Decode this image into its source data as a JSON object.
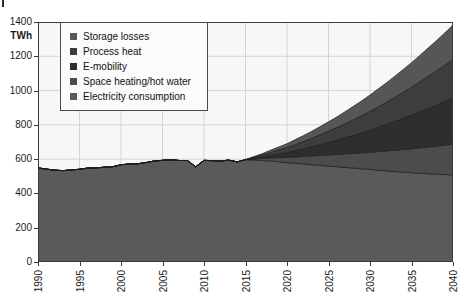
{
  "chart_data": {
    "type": "area",
    "stacked": true,
    "title": "",
    "subtitle": "",
    "xlabel": "",
    "ylabel": "TWh",
    "unit_label": "TWh",
    "grid": true,
    "legend_position": "top-left-inside",
    "xlim": [
      1990,
      2040
    ],
    "ylim": [
      0,
      1400
    ],
    "ytick_step": 200,
    "ytick_labels": [
      "0",
      "200",
      "400",
      "600",
      "800",
      "1000",
      "1200",
      "1400"
    ],
    "ytick_values": [
      0,
      200,
      400,
      600,
      800,
      1000,
      1200,
      1400
    ],
    "xtick_labels": [
      "1990",
      "1995",
      "2000",
      "2005",
      "2010",
      "2015",
      "2020",
      "2025",
      "2030",
      "2035",
      "2040"
    ],
    "xtick_values": [
      1990,
      1995,
      2000,
      2005,
      2010,
      2015,
      2020,
      2025,
      2030,
      2035,
      2040
    ],
    "x": [
      1990,
      1991,
      1992,
      1993,
      1994,
      1995,
      1996,
      1997,
      1998,
      1999,
      2000,
      2001,
      2002,
      2003,
      2004,
      2005,
      2006,
      2007,
      2008,
      2009,
      2010,
      2011,
      2012,
      2013,
      2014,
      2015,
      2016,
      2017,
      2018,
      2019,
      2020,
      2021,
      2022,
      2023,
      2024,
      2025,
      2026,
      2027,
      2028,
      2029,
      2030,
      2031,
      2032,
      2033,
      2034,
      2035,
      2036,
      2037,
      2038,
      2039,
      2040
    ],
    "series": [
      {
        "name": "Electricity consumption",
        "color": "#5a5a5a",
        "values": [
          549,
          542,
          536,
          533,
          537,
          541,
          548,
          549,
          553,
          556,
          567,
          572,
          573,
          580,
          589,
          593,
          597,
          592,
          592,
          555,
          593,
          591,
          590,
          594,
          584,
          597,
          595,
          592,
          589,
          585,
          580,
          576,
          572,
          568,
          564,
          560,
          556,
          552,
          548,
          544,
          540,
          536,
          532,
          528,
          524,
          521,
          518,
          515,
          512,
          510,
          508
        ]
      },
      {
        "name": "Space heating/hot water",
        "color": "#4c4c4c",
        "values": [
          0,
          0,
          0,
          0,
          0,
          0,
          0,
          0,
          0,
          0,
          0,
          0,
          0,
          0,
          0,
          0,
          0,
          0,
          0,
          0,
          0,
          0,
          0,
          0,
          0,
          0,
          6,
          12,
          18,
          24,
          30,
          37,
          44,
          51,
          58,
          65,
          72,
          79,
          86,
          93,
          100,
          108,
          116,
          124,
          132,
          140,
          148,
          156,
          164,
          172,
          180
        ]
      },
      {
        "name": "E-mobility",
        "color": "#2e2e2e",
        "values": [
          0,
          0,
          0,
          0,
          0,
          0,
          0,
          0,
          0,
          0,
          0,
          0,
          0,
          0,
          0,
          0,
          0,
          0,
          0,
          0,
          0,
          0,
          0,
          0,
          0,
          0,
          5,
          10,
          16,
          22,
          29,
          37,
          45,
          54,
          63,
          73,
          83,
          94,
          105,
          117,
          129,
          142,
          155,
          168,
          182,
          196,
          210,
          225,
          240,
          255,
          270
        ]
      },
      {
        "name": "Process heat",
        "color": "#3d3d3d",
        "values": [
          0,
          0,
          0,
          0,
          0,
          0,
          0,
          0,
          0,
          0,
          0,
          0,
          0,
          0,
          0,
          0,
          0,
          0,
          0,
          0,
          0,
          0,
          0,
          0,
          0,
          0,
          5,
          10,
          16,
          22,
          28,
          35,
          42,
          49,
          57,
          65,
          73,
          82,
          91,
          100,
          110,
          120,
          130,
          141,
          152,
          163,
          175,
          187,
          199,
          211,
          224
        ]
      },
      {
        "name": "Storage losses",
        "color": "#565656",
        "values": [
          0,
          0,
          0,
          0,
          0,
          0,
          0,
          0,
          0,
          0,
          0,
          0,
          0,
          0,
          0,
          0,
          0,
          0,
          0,
          0,
          0,
          0,
          0,
          0,
          0,
          0,
          4,
          8,
          13,
          18,
          23,
          29,
          35,
          41,
          48,
          55,
          62,
          70,
          78,
          86,
          95,
          104,
          113,
          123,
          133,
          143,
          154,
          165,
          176,
          188,
          200
        ]
      }
    ],
    "totals_note": {
      "start_year_total": 549,
      "end_year_total": 1382
    }
  },
  "legend": {
    "items": [
      {
        "label": "Storage losses",
        "color": "#565656"
      },
      {
        "label": "Process heat",
        "color": "#3d3d3d"
      },
      {
        "label": "E-mobility",
        "color": "#2e2e2e"
      },
      {
        "label": "Space heating/hot water",
        "color": "#4c4c4c"
      },
      {
        "label": "Electricity consumption",
        "color": "#5a5a5a"
      }
    ]
  },
  "axis": {
    "unit": "TWh"
  }
}
